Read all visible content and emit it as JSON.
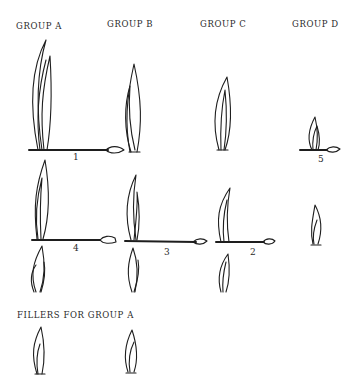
{
  "headers": {
    "group_a": "GROUP A",
    "group_b": "GROUP B",
    "group_c": "GROUP C",
    "group_d": "GROUP D"
  },
  "numbers": {
    "n1": "1",
    "n2": "2",
    "n3": "3",
    "n4": "4",
    "n5": "5"
  },
  "fillers": {
    "title": "FILLERS FOR GROUP A"
  },
  "colors": {
    "ink": "#1e1e1e",
    "background": "#ffffff"
  }
}
